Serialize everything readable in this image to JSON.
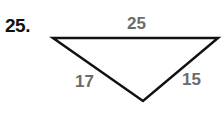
{
  "problem": {
    "number": "25.",
    "figure": "triangle",
    "sides": {
      "top": "25",
      "left": "17",
      "right": "15"
    },
    "colors": {
      "number": "#111111",
      "labels": "#6b6b6b",
      "lines": "#111111"
    }
  }
}
